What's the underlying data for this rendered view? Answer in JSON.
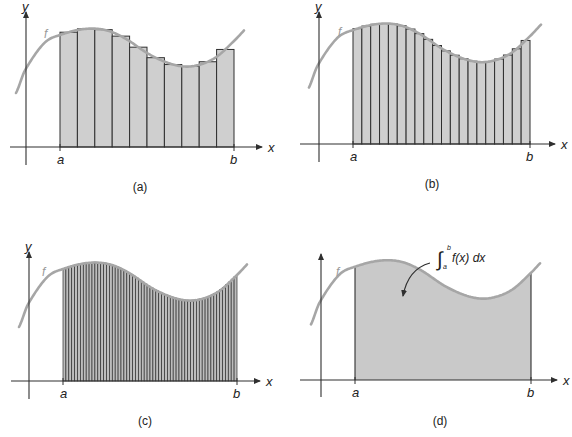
{
  "figure": {
    "panels": [
      {
        "id": "a",
        "caption": "(a)",
        "rectangles": 10,
        "mode": "rects",
        "show_y_label": true,
        "labels": {
          "y": "y",
          "x": "x",
          "a": "a",
          "b": "b",
          "f": "f"
        },
        "origin": [
          26,
          147
        ],
        "a_px": 60,
        "b_px": 234,
        "axis": {
          "x_start": 10,
          "x_end": 262,
          "y_top": 12,
          "y_bottom": 165
        },
        "curve_extent": [
          16,
          244
        ],
        "caption_pos": [
          140,
          187
        ],
        "f_pos": [
          44,
          38
        ]
      },
      {
        "id": "b",
        "caption": "(b)",
        "rectangles": 20,
        "mode": "rects",
        "show_y_label": true,
        "labels": {
          "y": "y",
          "x": "x",
          "a": "a",
          "b": "b",
          "f": "f"
        },
        "origin": [
          319,
          144
        ],
        "a_px": 353,
        "b_px": 530,
        "axis": {
          "x_start": 300,
          "x_end": 555,
          "y_top": 12,
          "y_bottom": 162
        },
        "curve_extent": [
          309,
          541
        ],
        "caption_pos": [
          432,
          184
        ],
        "f_pos": [
          338,
          36
        ]
      },
      {
        "id": "c",
        "caption": "(c)",
        "rectangles": 60,
        "mode": "rects",
        "show_y_label": true,
        "labels": {
          "y": "y",
          "x": "x",
          "a": "a",
          "b": "b",
          "f": "f"
        },
        "origin": [
          29,
          381
        ],
        "a_px": 63,
        "b_px": 237,
        "axis": {
          "x_start": 11,
          "x_end": 260,
          "y_top": 252,
          "y_bottom": 399
        },
        "curve_extent": [
          19,
          247
        ],
        "caption_pos": [
          145,
          421
        ],
        "f_pos": [
          42,
          276
        ]
      },
      {
        "id": "d",
        "caption": "(d)",
        "rectangles": 0,
        "mode": "area",
        "show_y_label": false,
        "labels": {
          "y": "",
          "x": "x",
          "a": "a",
          "b": "b",
          "f": "f"
        },
        "origin": [
          321,
          380
        ],
        "a_px": 355,
        "b_px": 531,
        "axis": {
          "x_start": 300,
          "x_end": 557,
          "y_top": 254,
          "y_bottom": 397
        },
        "curve_extent": [
          311,
          540
        ],
        "caption_pos": [
          440,
          421
        ],
        "f_pos": [
          336,
          276
        ],
        "annotation": {
          "integral_sign": "∫",
          "lower_limit": "a",
          "upper_limit": "b",
          "integrand": "f(x) dx",
          "sign_pos": [
            437,
            266
          ],
          "text_pos": [
            452,
            262
          ],
          "arrow_from": [
            430,
            263
          ],
          "arrow_to": [
            403,
            296
          ]
        }
      }
    ]
  },
  "curve": {
    "name": "f",
    "note": "normalized shape: t=(x-a)/(b-a), h in px above x-axis at panel-(a) scale (b-a=174px)",
    "t": [
      -0.24,
      -0.2,
      -0.09,
      0.0,
      0.14,
      0.26,
      0.37,
      0.52,
      0.66,
      0.77,
      0.89,
      1.0,
      1.06
    ],
    "h": [
      59,
      77,
      104,
      112,
      118,
      117,
      109,
      92,
      82,
      81,
      89,
      106,
      117
    ]
  },
  "colors": {
    "background": "#ffffff",
    "fill": "#cfcfcf",
    "area_fill": "#c9c9c9",
    "stroke": "#2f2f2f",
    "curve": "#a6a6a6",
    "f_label": "#9a9a9a",
    "text": "#222222"
  }
}
